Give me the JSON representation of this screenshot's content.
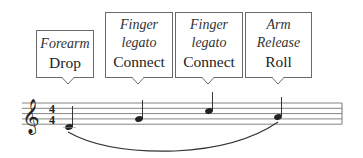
{
  "callouts": [
    {
      "italic_lines": [
        "Forearm"
      ],
      "label": "Drop"
    },
    {
      "italic_lines": [
        "Finger",
        "legato"
      ],
      "label": "Connect"
    },
    {
      "italic_lines": [
        "Finger",
        "legato"
      ],
      "label": "Connect"
    },
    {
      "italic_lines": [
        "Arm",
        "Release"
      ],
      "label": "Roll"
    }
  ],
  "staff": {
    "clef": "treble",
    "time_signature": "4/4",
    "notes": [
      "C4",
      "E4",
      "A4",
      "G4"
    ],
    "note_values": "quarter",
    "slur": "C4 to G4"
  }
}
